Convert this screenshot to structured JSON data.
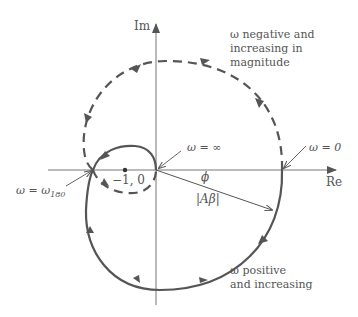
{
  "figure": {
    "type": "Nyquist plot",
    "axes": {
      "x_label": "Re",
      "y_label": "Im"
    },
    "labels": {
      "critical_point": "−1, 0",
      "omega_infinity": "ω = ∞",
      "omega_zero": "ω = 0",
      "omega_180_prefix": "ω = ω",
      "omega_180_sub": "180",
      "phase": "ϕ",
      "magnitude": "|Aβ|",
      "negative_line1": "ω negative and",
      "negative_line2": "increasing in",
      "negative_line3": "magnitude",
      "positive_line1": "ω positive",
      "positive_line2": "and increasing"
    },
    "curves": [
      {
        "name": "positive-frequency",
        "style": "solid",
        "description": "from ω=0 on positive real axis, clockwise through lower half, up to ω180 crossing, loops over to origin at ω=∞"
      },
      {
        "name": "negative-frequency",
        "style": "dashed",
        "description": "mirror image: from origin below axis, through upper half back to ω=0"
      }
    ],
    "colors": {
      "curve": "#555555",
      "axis": "#777777",
      "text": "#555555"
    }
  }
}
